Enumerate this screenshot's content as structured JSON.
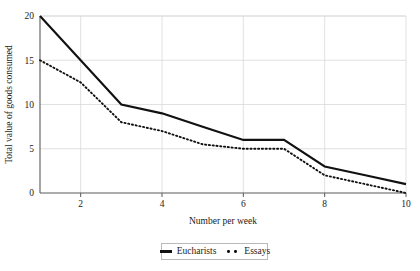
{
  "chart_data": {
    "type": "line",
    "title": "",
    "xlabel": "Number per week",
    "ylabel": "Total value of goods consumed",
    "x": [
      1,
      2,
      3,
      4,
      5,
      6,
      7,
      8,
      9,
      10
    ],
    "xlim": [
      1,
      10
    ],
    "ylim": [
      0,
      20
    ],
    "xticks": [
      2,
      4,
      6,
      8,
      10
    ],
    "yticks": [
      0,
      5,
      10,
      15,
      20
    ],
    "xtick_labels": [
      "2",
      "4",
      "6",
      "8",
      "10"
    ],
    "ytick_labels": [
      "0",
      "5",
      "10",
      "15",
      "20"
    ],
    "grid": true,
    "grid_axis": "both",
    "legend_position": "bottom-center",
    "series": [
      {
        "name": "Eucharists",
        "style": "solid",
        "color": "#111111",
        "values": [
          20,
          15,
          10,
          9,
          7.5,
          6,
          6,
          3,
          2,
          1
        ]
      },
      {
        "name": "Essays",
        "style": "dotted",
        "color": "#111111",
        "values": [
          15,
          12.5,
          8,
          7,
          5.5,
          5,
          5,
          2,
          1,
          0
        ]
      }
    ]
  },
  "legend": {
    "entries": [
      {
        "label": "Eucharists",
        "marker": "solid-line-swatch"
      },
      {
        "label": "Essays",
        "marker": "dotted-line-swatch"
      }
    ]
  }
}
